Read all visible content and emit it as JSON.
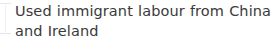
{
  "panel": {
    "role": "text-snippet",
    "background_color": "#ffffff",
    "text_color": "#3a3a3a",
    "rule_color": "#e6e6e6"
  },
  "snippet": {
    "text": "Used immigrant labour from China and Ireland",
    "line_1": "Used immigrant labour from China and",
    "line_2": "Ireland",
    "line_count": 2
  }
}
